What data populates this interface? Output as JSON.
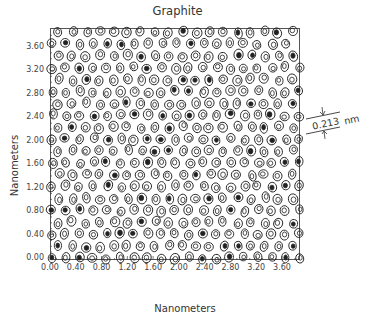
{
  "chart_data": {
    "type": "scatter",
    "title": "Graphite",
    "xlabel": "Nanometers",
    "ylabel": "Nanometers",
    "xlim": [
      0.0,
      3.9
    ],
    "ylim": [
      0.0,
      3.9
    ],
    "x_ticks": [
      "0.00",
      "0.40",
      "0.80",
      "1.20",
      "1.60",
      "2.00",
      "2.40",
      "2.80",
      "3.20",
      "3.60"
    ],
    "y_ticks": [
      "0.00",
      "0.40",
      "0.80",
      "1.20",
      "1.60",
      "2.00",
      "2.40",
      "2.80",
      "3.20",
      "3.60"
    ],
    "grid": false,
    "legend": null,
    "lattice_spacing_nm": 0.213,
    "annotation": {
      "value": "0.213",
      "unit": "nm"
    }
  },
  "labels": {
    "title": "Graphite",
    "xlabel": "Nanometers",
    "ylabel": "Nanometers",
    "annotation_value": "0.213",
    "annotation_unit": "nm"
  },
  "colors": {
    "ink": "#222222",
    "frame": "#555555",
    "background": "#ffffff"
  }
}
